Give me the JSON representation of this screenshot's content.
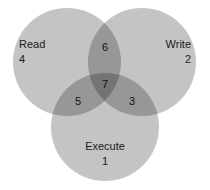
{
  "diagram": {
    "background_color": "#ffffff",
    "circle_fill_color": "#c4c4c4",
    "single_region_color": "#9c9c9c",
    "double_region_color": "#7a7a7a",
    "triple_region_color": "#5a5a5a",
    "text_color": "#1a1a1a"
  },
  "sets": {
    "read": {
      "label": "Read",
      "value": "4"
    },
    "write": {
      "label": "Write",
      "value": "2"
    },
    "execute": {
      "label": "Execute",
      "value": "1"
    }
  },
  "regions": {
    "read_write": "6",
    "read_execute": "5",
    "write_execute": "3",
    "read_write_execute": "7"
  },
  "chart_data": {
    "type": "venn",
    "sets": [
      {
        "name": "Read",
        "value": 4
      },
      {
        "name": "Write",
        "value": 2
      },
      {
        "name": "Execute",
        "value": 1
      }
    ],
    "intersections": [
      {
        "sets": [
          "Read",
          "Write"
        ],
        "value": 6
      },
      {
        "sets": [
          "Read",
          "Execute"
        ],
        "value": 5
      },
      {
        "sets": [
          "Write",
          "Execute"
        ],
        "value": 3
      },
      {
        "sets": [
          "Read",
          "Write",
          "Execute"
        ],
        "value": 7
      }
    ],
    "legend": "none",
    "grid": false
  }
}
